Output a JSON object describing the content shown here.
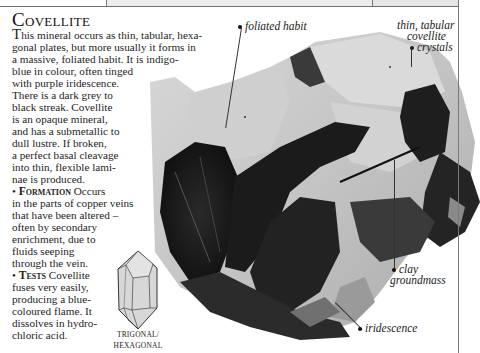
{
  "page": {
    "title": "Covellite",
    "intro_dropcap": "T",
    "body_lines": [
      "his mineral occurs as thin, tabular, hexa-",
      "gonal plates, but more usually it forms in",
      "a massive, foliated habit. It is indigo-",
      "blue in colour, often tinged",
      "with purple iridescence.",
      "There is a dark grey to",
      "black streak. Covellite",
      "is an opaque mineral,",
      "and has a submetallic to",
      "dull lustre. If broken,",
      "a perfect basal cleavage",
      "into thin, flexible lami-",
      "nae is produced."
    ],
    "formation": {
      "bullet": "•",
      "heading": "Formation",
      "lines": [
        " Occurs",
        "in the parts of copper veins",
        "that have been altered –",
        "often by secondary",
        "enrichment, due to",
        "fluids seeping",
        "through the vein."
      ]
    },
    "tests": {
      "bullet": "•",
      "heading": "Tests",
      "lines": [
        " Covellite",
        "fuses very easily,",
        "producing a blue-",
        "coloured flame. It",
        "dissolves in hydro-",
        "chloric acid."
      ]
    },
    "crystal_system": {
      "icon": "trigonal-hexagonal-crystal-icon",
      "label_line1": "TRIGONAL/",
      "label_line2": "HEXAGONAL"
    },
    "annotations": [
      {
        "id": "foliated-habit",
        "text": "foliated habit"
      },
      {
        "id": "thin-tabular",
        "lines": [
          "thin, tabular",
          "covellite",
          "crystals"
        ]
      },
      {
        "id": "clay-groundmass",
        "lines": [
          "clay",
          "groundmass"
        ]
      },
      {
        "id": "iridescence",
        "text": "iridescence"
      }
    ]
  }
}
